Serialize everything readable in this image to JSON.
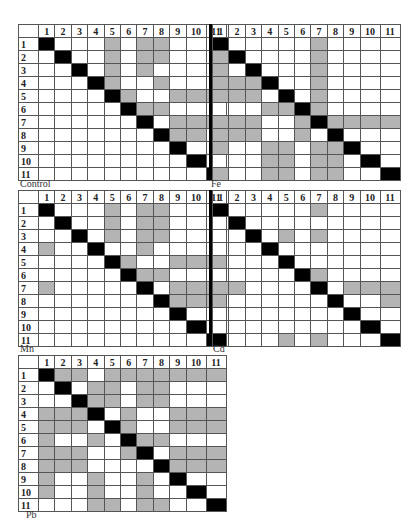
{
  "figure": {
    "panels": [
      {
        "label": "Control",
        "id": "control"
      },
      {
        "label": "Fe",
        "id": "fe"
      },
      {
        "label": "Mn",
        "id": "mn"
      },
      {
        "label": "Cd",
        "id": "cd"
      },
      {
        "label": "Pb",
        "id": "pb"
      }
    ],
    "colors": {
      "significant": "#b4b4b4",
      "diagonal": "#000000",
      "empty": "#ffffff",
      "grid": "#555555"
    }
  },
  "chart_data": [
    {
      "type": "heatmap",
      "title": "Control",
      "categories": [
        "1",
        "2",
        "3",
        "4",
        "5",
        "6",
        "7",
        "8",
        "9",
        "10",
        "11"
      ],
      "cell_values": "1 = shaded (gray), 0 = blank, diagonal = black",
      "shaded": {
        "1": [
          5,
          7,
          8
        ],
        "2": [
          5,
          7,
          8
        ],
        "3": [
          5,
          7
        ],
        "4": [
          5,
          8
        ],
        "5": [
          6,
          9,
          10,
          11
        ],
        "6": [
          7,
          8
        ],
        "7": [
          9,
          10,
          11
        ],
        "8": [
          9,
          10
        ],
        "9": [],
        "10": [],
        "11": []
      }
    },
    {
      "type": "heatmap",
      "title": "Fe",
      "categories": [
        "1",
        "2",
        "3",
        "4",
        "5",
        "6",
        "7",
        "8",
        "9",
        "10",
        "11"
      ],
      "shaded": {
        "1": [
          7
        ],
        "2": [
          1,
          7
        ],
        "3": [
          1,
          7
        ],
        "4": [
          1,
          2,
          3,
          7
        ],
        "5": [
          1,
          2,
          3,
          7
        ],
        "6": [
          4,
          5,
          7
        ],
        "7": [
          1,
          2,
          3,
          6,
          8,
          9,
          10,
          11
        ],
        "8": [
          1,
          2,
          3,
          6
        ],
        "9": [
          1,
          4,
          5,
          7,
          8
        ],
        "10": [
          4,
          5,
          7,
          8
        ],
        "11": [
          1,
          4,
          5,
          7,
          8
        ]
      }
    },
    {
      "type": "heatmap",
      "title": "Mn",
      "categories": [
        "1",
        "2",
        "3",
        "4",
        "5",
        "6",
        "7",
        "8",
        "9",
        "10",
        "11"
      ],
      "shaded": {
        "1": [
          5,
          7,
          8
        ],
        "2": [
          5,
          7,
          8
        ],
        "3": [
          5,
          7,
          8
        ],
        "4": [
          1,
          7
        ],
        "5": [
          6,
          9,
          10,
          11
        ],
        "6": [
          7,
          8
        ],
        "7": [
          1,
          9,
          10,
          11
        ],
        "8": [
          9,
          10,
          11
        ],
        "9": [],
        "10": [],
        "11": []
      }
    },
    {
      "type": "heatmap",
      "title": "Cd",
      "categories": [
        "1",
        "2",
        "3",
        "4",
        "5",
        "6",
        "7",
        "8",
        "9",
        "10",
        "11"
      ],
      "shaded": {
        "1": [
          7
        ],
        "2": [],
        "3": [
          5,
          7
        ],
        "4": [],
        "5": [],
        "6": [
          7
        ],
        "7": [
          1,
          2,
          9,
          10,
          11
        ],
        "8": [
          11
        ],
        "9": [],
        "10": [],
        "11": [
          5,
          7
        ]
      }
    },
    {
      "type": "heatmap",
      "title": "Pb",
      "categories": [
        "1",
        "2",
        "3",
        "4",
        "5",
        "6",
        "7",
        "8",
        "9",
        "10",
        "11"
      ],
      "shaded": {
        "1": [
          2,
          3,
          5,
          6,
          7,
          8,
          9,
          10,
          11
        ],
        "2": [
          4,
          5,
          7,
          8
        ],
        "3": [
          4,
          5,
          7,
          8
        ],
        "4": [
          1,
          2,
          3,
          6,
          9,
          10,
          11
        ],
        "5": [
          1,
          2,
          3,
          6,
          9,
          10,
          11
        ],
        "6": [
          1,
          4,
          7,
          8
        ],
        "7": [
          1,
          2,
          3,
          6,
          9,
          10,
          11
        ],
        "8": [
          1,
          2,
          3,
          9,
          10,
          11
        ],
        "9": [
          1,
          4,
          7
        ],
        "10": [
          1,
          4,
          7
        ],
        "11": [
          4,
          5,
          7,
          8
        ]
      }
    }
  ]
}
